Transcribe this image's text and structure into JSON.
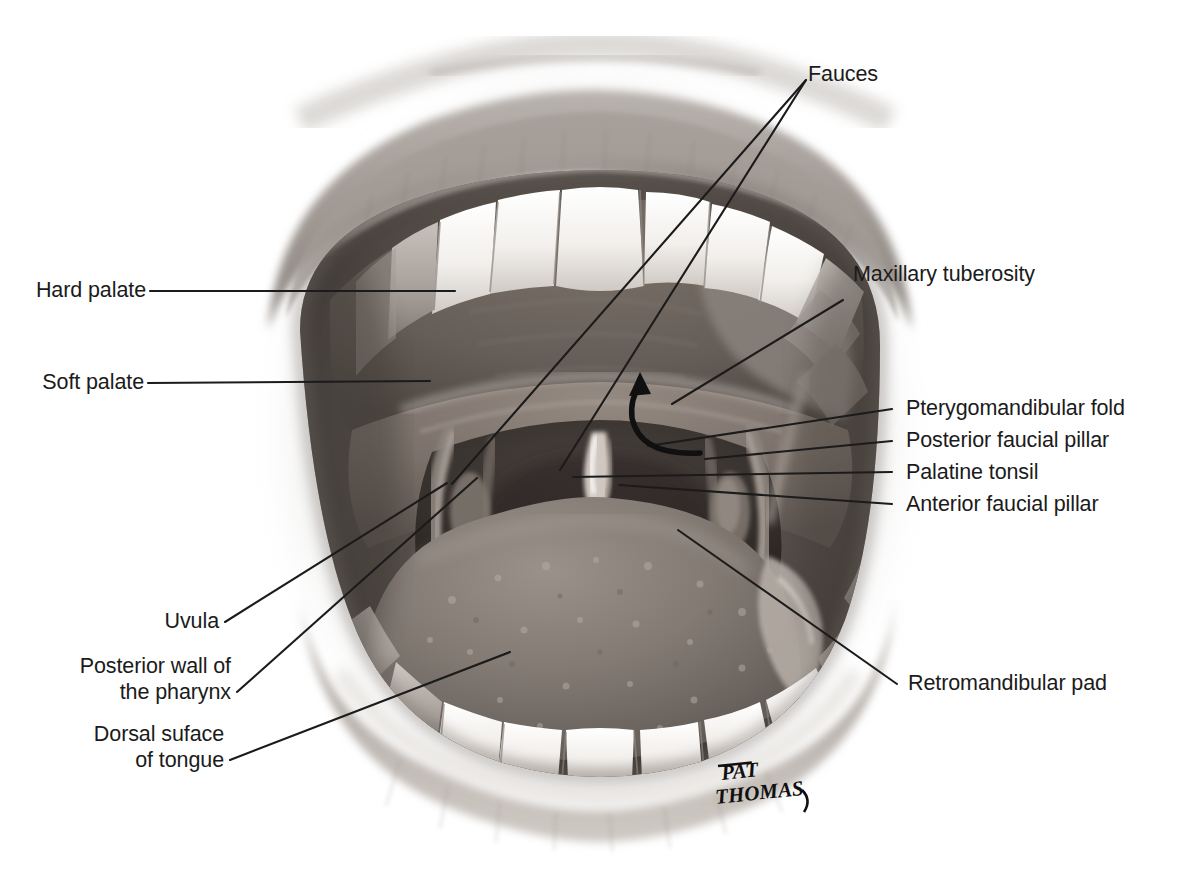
{
  "figure": {
    "kind": "anatomical-illustration",
    "background_color": "#ffffff",
    "ink_color": "#1b1b1b",
    "signature": {
      "line1": "PAT",
      "line2": "THOMAS"
    }
  },
  "labels": {
    "fauces": "Fauces",
    "hard_palate": "Hard palate",
    "soft_palate": "Soft palate",
    "maxillary_tuberosity": "Maxillary tuberosity",
    "pterygomandibular_fold": "Pterygomandibular fold",
    "posterior_faucial_pillar": "Posterior faucial pillar",
    "palatine_tonsil": "Palatine tonsil",
    "anterior_faucial_pillar": "Anterior faucial pillar",
    "retromandibular_pad": "Retromandibular pad",
    "uvula": "Uvula",
    "posterior_wall_l1": "Posterior wall of",
    "posterior_wall_l2": "the pharynx",
    "dorsal_tongue_l1": "Dorsal suface",
    "dorsal_tongue_l2": "of tongue"
  },
  "parts": [
    "upper lip",
    "lower lip",
    "upper teeth",
    "lower teeth",
    "hard palate",
    "soft palate",
    "uvula",
    "palatine tonsil",
    "anterior faucial pillar",
    "posterior faucial pillar",
    "pterygomandibular fold",
    "maxillary tuberosity",
    "retromandibular pad",
    "dorsal surface of tongue",
    "posterior wall of the pharynx",
    "fauces"
  ]
}
